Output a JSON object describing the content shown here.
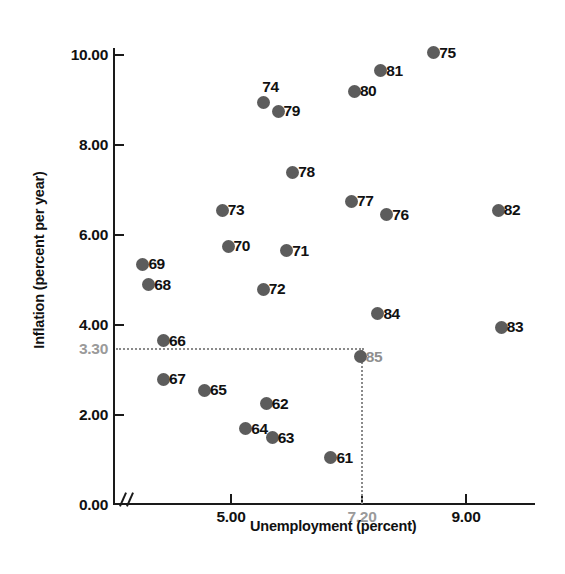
{
  "chart_data": {
    "type": "scatter",
    "title": "",
    "xlabel": "Unemployment (percent)",
    "ylabel": "Inflation (percent per year)",
    "xlim": [
      3.0,
      10.2
    ],
    "ylim": [
      0.0,
      10.6
    ],
    "grid": false,
    "legend": null,
    "x_ticks": [
      {
        "value": 5.0,
        "label": "5.00",
        "muted": false
      },
      {
        "value": 7.2,
        "label": "7.20",
        "muted": true
      },
      {
        "value": 9.0,
        "label": "9.00",
        "muted": false
      }
    ],
    "y_ticks": [
      {
        "value": 10.0,
        "label": "10.00",
        "muted": false
      },
      {
        "value": 8.0,
        "label": "8.00",
        "muted": false
      },
      {
        "value": 6.0,
        "label": "6.00",
        "muted": false
      },
      {
        "value": 4.0,
        "label": "4.00",
        "muted": false
      },
      {
        "value": 3.3,
        "label": "3.30",
        "muted": true
      },
      {
        "value": 2.0,
        "label": "2.00",
        "muted": false
      },
      {
        "value": 0.0,
        "label": "0.00",
        "muted": false
      }
    ],
    "annotations": {
      "guide_lines": {
        "horizontal_value": 3.3,
        "vertical_value": 7.2,
        "style": "dotted",
        "color": "#8a8a8a"
      },
      "axis_break": "y-axis break between 0.00 and first plotted value"
    },
    "point_color": "#5c5c5c",
    "points": [
      {
        "label": "61",
        "x": 6.7,
        "y": 1.05,
        "label_side": "right",
        "muted": false
      },
      {
        "label": "62",
        "x": 5.6,
        "y": 2.25,
        "label_side": "right",
        "muted": false
      },
      {
        "label": "63",
        "x": 5.7,
        "y": 1.5,
        "label_side": "right",
        "muted": false
      },
      {
        "label": "64",
        "x": 5.25,
        "y": 1.7,
        "label_side": "right",
        "muted": false
      },
      {
        "label": "65",
        "x": 4.55,
        "y": 2.55,
        "label_side": "right",
        "muted": false
      },
      {
        "label": "66",
        "x": 3.85,
        "y": 3.65,
        "label_side": "right",
        "muted": false
      },
      {
        "label": "67",
        "x": 3.85,
        "y": 2.8,
        "label_side": "right",
        "muted": false
      },
      {
        "label": "68",
        "x": 3.6,
        "y": 4.9,
        "label_side": "right",
        "muted": false
      },
      {
        "label": "69",
        "x": 3.5,
        "y": 5.35,
        "label_side": "right",
        "muted": false
      },
      {
        "label": "70",
        "x": 4.95,
        "y": 5.75,
        "label_side": "right",
        "muted": false
      },
      {
        "label": "71",
        "x": 5.95,
        "y": 5.65,
        "label_side": "right",
        "muted": false
      },
      {
        "label": "72",
        "x": 5.55,
        "y": 4.8,
        "label_side": "right",
        "muted": false
      },
      {
        "label": "73",
        "x": 4.85,
        "y": 6.55,
        "label_side": "right",
        "muted": false
      },
      {
        "label": "74",
        "x": 5.55,
        "y": 8.95,
        "label_side": "above",
        "muted": false
      },
      {
        "label": "79",
        "x": 5.8,
        "y": 8.75,
        "label_side": "right",
        "muted": false
      },
      {
        "label": "75",
        "x": 8.45,
        "y": 10.05,
        "label_side": "right",
        "muted": false
      },
      {
        "label": "76",
        "x": 7.65,
        "y": 6.45,
        "label_side": "right",
        "muted": false
      },
      {
        "label": "77",
        "x": 7.05,
        "y": 6.75,
        "label_side": "right",
        "muted": false
      },
      {
        "label": "78",
        "x": 6.05,
        "y": 7.4,
        "label_side": "right",
        "muted": false
      },
      {
        "label": "80",
        "x": 7.1,
        "y": 9.2,
        "label_side": "right",
        "muted": false
      },
      {
        "label": "81",
        "x": 7.55,
        "y": 9.65,
        "label_side": "right",
        "muted": false
      },
      {
        "label": "82",
        "x": 9.55,
        "y": 6.55,
        "label_side": "right",
        "muted": false
      },
      {
        "label": "83",
        "x": 9.6,
        "y": 3.95,
        "label_side": "right",
        "muted": false
      },
      {
        "label": "84",
        "x": 7.5,
        "y": 4.25,
        "label_side": "right",
        "muted": false
      },
      {
        "label": "85",
        "x": 7.2,
        "y": 3.3,
        "label_side": "right",
        "muted": true
      }
    ]
  },
  "axes": {
    "y_title": "Inflation (percent per year)",
    "x_title": "Unemployment (percent)"
  },
  "caption": {
    "text": ""
  }
}
